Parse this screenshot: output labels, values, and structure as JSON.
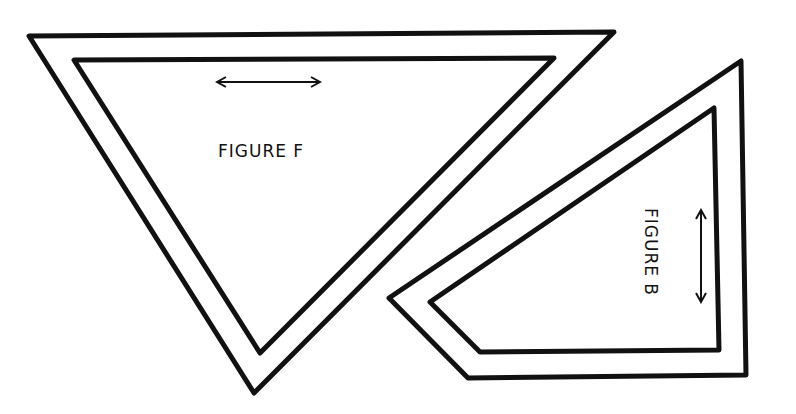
{
  "figures": [
    {
      "id": "F",
      "label": "FIGURE F",
      "outer": [
        [
          29,
          36
        ],
        [
          614,
          32
        ],
        [
          254,
          393
        ]
      ],
      "inner": [
        [
          74,
          60
        ],
        [
          554,
          58
        ],
        [
          260,
          353
        ]
      ],
      "grain_arrow": {
        "orientation": "horizontal",
        "from": [
          217,
          82
        ],
        "to": [
          320,
          82
        ]
      },
      "label_pos": [
        218,
        157
      ]
    },
    {
      "id": "B",
      "label": "FIGURE B",
      "outer": [
        [
          741,
          61
        ],
        [
          746,
          375
        ],
        [
          468,
          378
        ],
        [
          389,
          298
        ]
      ],
      "inner": [
        [
          714,
          108
        ],
        [
          719,
          350
        ],
        [
          480,
          352
        ],
        [
          430,
          302
        ]
      ],
      "grain_arrow": {
        "orientation": "vertical",
        "from": [
          701,
          210
        ],
        "to": [
          701,
          302
        ]
      },
      "label_pos": [
        645,
        208
      ]
    }
  ],
  "colors": {
    "stroke": "#111111",
    "background": "#ffffff"
  }
}
